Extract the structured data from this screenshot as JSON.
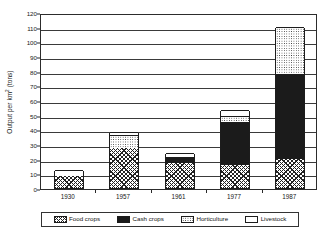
{
  "chart_data": {
    "type": "bar",
    "subtype": "stacked-bar",
    "title": "",
    "xlabel": "",
    "ylabel": "Output per km2 (tons)",
    "ylabel_parts": {
      "prefix": "Output per km",
      "sup": "2",
      "suffix": " (tons)"
    },
    "categories": [
      "1930",
      "1957",
      "1961",
      "1977",
      "1987"
    ],
    "ylim": [
      0,
      120
    ],
    "ytick_step": 10,
    "yticks": [
      0,
      10,
      20,
      30,
      40,
      50,
      60,
      70,
      80,
      90,
      100,
      110,
      120
    ],
    "ytick_labels": [
      "0",
      "10",
      "20",
      "30",
      "40",
      "50",
      "60",
      "70",
      "80",
      "90",
      "100",
      "110",
      "120"
    ],
    "grid": true,
    "grid_axis": "y",
    "legend_position": "bottom",
    "series": [
      {
        "name": "Food crops",
        "pattern": "cross-hatch",
        "values": [
          8,
          27,
          17,
          16,
          20
        ]
      },
      {
        "name": "Cash crops",
        "pattern": "solid-black",
        "values": [
          0,
          0,
          4,
          29,
          58
        ]
      },
      {
        "name": "Horticulture",
        "pattern": "dotted",
        "values": [
          0,
          9,
          0,
          4,
          32
        ]
      },
      {
        "name": "Livestock",
        "pattern": "empty-white",
        "values": [
          4,
          2,
          3,
          4,
          0
        ]
      }
    ],
    "totals": [
      12,
      38,
      24,
      53,
      110
    ]
  },
  "legend": {
    "items": [
      {
        "label": "Food crops",
        "pattern": "cross-hatch"
      },
      {
        "label": "Cash crops",
        "pattern": "solid-black"
      },
      {
        "label": "Horticulture",
        "pattern": "dotted"
      },
      {
        "label": "Livestock",
        "pattern": "empty-white"
      }
    ]
  },
  "colors": {
    "axis": "#2c2c2c",
    "gridline": "#3a3a3a",
    "bar_outline": "#1c1c1c",
    "cash_crops_fill": "#1b1b1b",
    "background": "#ffffff",
    "text": "#171717"
  }
}
